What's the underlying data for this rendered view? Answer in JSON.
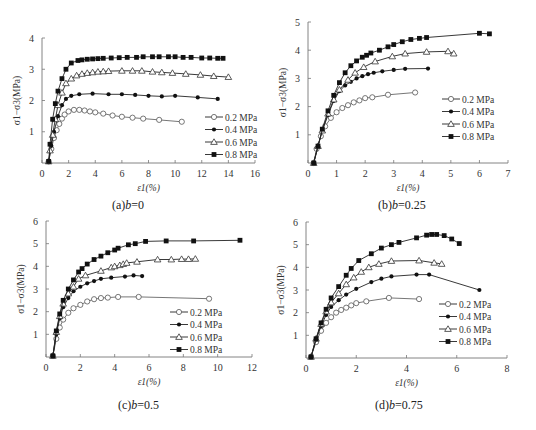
{
  "figure": {
    "panels": [
      {
        "id": "a",
        "caption_prefix": "(a)",
        "caption_var": "b",
        "caption_value": "=0"
      },
      {
        "id": "b",
        "caption_prefix": "(b)",
        "caption_var": "b",
        "caption_value": "=0.25"
      },
      {
        "id": "c",
        "caption_prefix": "(c)",
        "caption_var": "b",
        "caption_value": "=0.5"
      },
      {
        "id": "d",
        "caption_prefix": "(d)",
        "caption_var": "b",
        "caption_value": "=0.75"
      }
    ],
    "xlabel": "ε1(%)",
    "ylabel": "σ1−σ3(MPa)",
    "legend": [
      "0.2  MPa",
      "0.4  MPa",
      "0.6  MPa",
      "0.8  MPa"
    ]
  },
  "chart_data": [
    {
      "type": "line",
      "title": "(a) b=0",
      "xlabel": "ε1(%)",
      "ylabel": "σ1−σ3(MPa)",
      "xlim": [
        0,
        16
      ],
      "ylim": [
        0,
        4
      ],
      "xticks": [
        0,
        2,
        4,
        6,
        8,
        10,
        12,
        14,
        16
      ],
      "yticks": [
        1,
        2,
        3,
        4
      ],
      "legend_position": "right-center",
      "grid": false,
      "series": [
        {
          "name": "0.2 MPa",
          "marker": "open-diamond",
          "x": [
            0.5,
            0.7,
            0.9,
            1.1,
            1.3,
            1.5,
            1.7,
            2.0,
            2.4,
            2.8,
            3.2,
            3.6,
            4.0,
            4.6,
            5.3,
            6.0,
            6.8,
            7.6,
            8.8,
            10.5
          ],
          "y": [
            0.05,
            0.45,
            0.8,
            1.05,
            1.25,
            1.42,
            1.55,
            1.65,
            1.7,
            1.7,
            1.68,
            1.65,
            1.62,
            1.58,
            1.52,
            1.48,
            1.45,
            1.42,
            1.38,
            1.32
          ]
        },
        {
          "name": "0.4 MPa",
          "marker": "filled-circle",
          "x": [
            0.5,
            0.7,
            0.9,
            1.2,
            1.5,
            1.8,
            2.2,
            2.8,
            3.8,
            5.0,
            6.0,
            7.0,
            8.0,
            9.0,
            10.0,
            11.7,
            13.2
          ],
          "y": [
            0.05,
            0.55,
            1.0,
            1.5,
            1.85,
            2.05,
            2.15,
            2.2,
            2.22,
            2.2,
            2.2,
            2.18,
            2.15,
            2.13,
            2.15,
            2.1,
            2.05
          ]
        },
        {
          "name": "0.6 MPa",
          "marker": "open-triangle",
          "x": [
            0.5,
            0.6,
            0.8,
            1.0,
            1.2,
            1.5,
            1.8,
            2.2,
            2.6,
            3.0,
            3.4,
            3.8,
            4.2,
            4.6,
            5.0,
            6.0,
            6.8,
            7.5,
            8.3,
            9.0,
            9.8,
            10.8,
            11.9,
            12.9,
            14.0
          ],
          "y": [
            0.05,
            0.4,
            0.9,
            1.4,
            1.85,
            2.25,
            2.55,
            2.7,
            2.8,
            2.85,
            2.88,
            2.9,
            2.92,
            2.93,
            2.94,
            2.95,
            2.95,
            2.95,
            2.92,
            2.9,
            2.88,
            2.85,
            2.82,
            2.78,
            2.75
          ]
        },
        {
          "name": "0.8 MPa",
          "marker": "filled-square",
          "x": [
            0.5,
            0.6,
            0.8,
            1.0,
            1.2,
            1.5,
            1.8,
            2.2,
            2.7,
            3.0,
            3.4,
            3.8,
            4.2,
            4.6,
            5.2,
            5.8,
            6.4,
            7.1,
            7.6,
            8.3,
            8.8,
            9.5,
            10.0,
            10.6,
            11.2,
            12.0,
            12.6,
            13.2,
            13.6
          ],
          "y": [
            0.05,
            0.6,
            1.4,
            1.9,
            2.3,
            2.7,
            3.0,
            3.2,
            3.28,
            3.3,
            3.32,
            3.33,
            3.34,
            3.35,
            3.36,
            3.37,
            3.38,
            3.38,
            3.4,
            3.4,
            3.4,
            3.4,
            3.4,
            3.38,
            3.38,
            3.36,
            3.36,
            3.35,
            3.35
          ]
        }
      ]
    },
    {
      "type": "line",
      "title": "(b) b=0.25",
      "xlabel": "ε1(%)",
      "ylabel": "σ1−σ3(MPa)",
      "xlim": [
        0,
        7
      ],
      "ylim": [
        0,
        5
      ],
      "xticks": [
        0,
        1,
        2,
        3,
        4,
        5,
        6,
        7
      ],
      "yticks": [
        1,
        2,
        3,
        4,
        5
      ],
      "legend_position": "right-center",
      "grid": false,
      "series": [
        {
          "name": "0.2 MPa",
          "marker": "open-diamond",
          "x": [
            0.2,
            0.3,
            0.45,
            0.6,
            0.8,
            1.0,
            1.2,
            1.4,
            1.6,
            1.8,
            2.0,
            2.25,
            2.8,
            3.75
          ],
          "y": [
            0.0,
            0.5,
            0.95,
            1.3,
            1.6,
            1.8,
            1.95,
            2.05,
            2.15,
            2.22,
            2.3,
            2.33,
            2.42,
            2.5
          ]
        },
        {
          "name": "0.4 MPa",
          "marker": "filled-circle",
          "x": [
            0.2,
            0.35,
            0.5,
            0.7,
            0.9,
            1.1,
            1.3,
            1.5,
            1.7,
            1.9,
            2.1,
            2.3,
            2.6,
            3.0,
            3.4,
            4.2
          ],
          "y": [
            0.0,
            0.6,
            1.15,
            1.7,
            2.2,
            2.55,
            2.75,
            2.88,
            3.0,
            3.08,
            3.15,
            3.2,
            3.25,
            3.3,
            3.34,
            3.35
          ]
        },
        {
          "name": "0.6 MPa",
          "marker": "open-triangle",
          "x": [
            0.2,
            0.35,
            0.5,
            0.7,
            0.9,
            1.1,
            1.4,
            1.65,
            1.95,
            2.35,
            2.95,
            3.4,
            4.15,
            4.9,
            5.1
          ],
          "y": [
            0.0,
            0.6,
            1.15,
            1.75,
            2.25,
            2.6,
            2.95,
            3.2,
            3.4,
            3.6,
            3.78,
            3.88,
            3.94,
            3.96,
            3.88
          ]
        },
        {
          "name": "0.8 MPa",
          "marker": "filled-square",
          "x": [
            0.2,
            0.35,
            0.5,
            0.7,
            0.9,
            1.1,
            1.3,
            1.5,
            1.7,
            1.9,
            2.05,
            2.2,
            2.5,
            2.8,
            3.0,
            3.3,
            3.6,
            3.9,
            4.15,
            6.0,
            6.35
          ],
          "y": [
            0.0,
            0.6,
            1.2,
            1.85,
            2.4,
            2.85,
            3.2,
            3.45,
            3.62,
            3.75,
            3.82,
            3.9,
            4.0,
            4.12,
            4.2,
            4.3,
            4.38,
            4.42,
            4.45,
            4.6,
            4.58
          ]
        }
      ]
    },
    {
      "type": "line",
      "title": "(c) b=0.5",
      "xlabel": "ε1(%)",
      "ylabel": "σ1−σ3(MPa)",
      "xlim": [
        0,
        12
      ],
      "ylim": [
        0,
        6
      ],
      "xticks": [
        0,
        2,
        4,
        6,
        8,
        10,
        12
      ],
      "yticks": [
        1,
        2,
        3,
        4,
        5,
        6
      ],
      "legend_position": "right-lower",
      "grid": false,
      "series": [
        {
          "name": "0.2 MPa",
          "marker": "open-diamond",
          "x": [
            0.4,
            0.6,
            0.8,
            1.0,
            1.3,
            1.6,
            2.0,
            2.4,
            2.8,
            3.2,
            3.6,
            4.2,
            5.4,
            9.5
          ],
          "y": [
            0.05,
            0.8,
            1.3,
            1.65,
            1.95,
            2.15,
            2.3,
            2.45,
            2.55,
            2.6,
            2.62,
            2.65,
            2.65,
            2.57
          ]
        },
        {
          "name": "0.4 MPa",
          "marker": "filled-circle",
          "x": [
            0.4,
            0.6,
            0.8,
            1.0,
            1.3,
            1.6,
            2.0,
            2.4,
            2.8,
            3.2,
            3.8,
            4.6,
            5.1,
            5.6
          ],
          "y": [
            0.05,
            1.0,
            1.7,
            2.2,
            2.6,
            2.9,
            3.1,
            3.25,
            3.35,
            3.45,
            3.5,
            3.55,
            3.6,
            3.57
          ]
        },
        {
          "name": "0.6 MPa",
          "marker": "open-triangle",
          "x": [
            0.4,
            0.6,
            0.8,
            1.0,
            1.3,
            1.6,
            1.9,
            2.3,
            3.2,
            3.8,
            4.0,
            4.3,
            4.5,
            4.7,
            5.3,
            6.5,
            7.3,
            7.9,
            8.3,
            8.7
          ],
          "y": [
            0.05,
            1.1,
            1.8,
            2.35,
            2.8,
            3.1,
            3.45,
            3.6,
            3.8,
            3.95,
            4.0,
            4.05,
            4.1,
            4.15,
            4.2,
            4.3,
            4.3,
            4.32,
            4.32,
            4.33
          ]
        },
        {
          "name": "0.8 MPa",
          "marker": "filled-square",
          "x": [
            0.4,
            0.6,
            0.8,
            1.0,
            1.3,
            1.6,
            1.9,
            2.1,
            2.4,
            2.8,
            3.2,
            3.6,
            4.0,
            4.2,
            4.8,
            5.2,
            5.8,
            7.0,
            8.6,
            11.3
          ],
          "y": [
            0.05,
            1.15,
            1.9,
            2.5,
            3.0,
            3.4,
            3.75,
            3.9,
            4.1,
            4.3,
            4.45,
            4.6,
            4.72,
            4.8,
            4.95,
            5.0,
            5.1,
            5.12,
            5.12,
            5.15
          ]
        }
      ]
    },
    {
      "type": "line",
      "title": "(d) b=0.75",
      "xlabel": "ε1(%)",
      "ylabel": "σ1−σ3(MPa)",
      "xlim": [
        0,
        8
      ],
      "ylim": [
        0,
        6
      ],
      "xticks": [
        0,
        2,
        4,
        6,
        8
      ],
      "yticks": [
        1,
        2,
        3,
        4,
        5,
        6
      ],
      "legend_position": "right-lower",
      "grid": false,
      "series": [
        {
          "name": "0.2 MPa",
          "marker": "open-diamond",
          "x": [
            0.2,
            0.4,
            0.6,
            0.8,
            1.0,
            1.2,
            1.4,
            1.6,
            1.8,
            2.0,
            2.4,
            3.3,
            4.5
          ],
          "y": [
            0.05,
            0.7,
            1.2,
            1.55,
            1.8,
            2.0,
            2.12,
            2.22,
            2.32,
            2.42,
            2.5,
            2.65,
            2.6
          ]
        },
        {
          "name": "0.4 MPa",
          "marker": "filled-circle",
          "x": [
            0.2,
            0.4,
            0.6,
            0.8,
            1.0,
            1.3,
            1.6,
            2.0,
            2.6,
            3.0,
            3.4,
            4.4,
            4.9,
            6.9
          ],
          "y": [
            0.05,
            0.8,
            1.4,
            1.9,
            2.25,
            2.55,
            2.8,
            3.05,
            3.35,
            3.5,
            3.6,
            3.68,
            3.68,
            3.0
          ]
        },
        {
          "name": "0.6 MPa",
          "marker": "open-triangle",
          "x": [
            0.2,
            0.4,
            0.6,
            0.8,
            1.0,
            1.3,
            1.6,
            1.9,
            2.2,
            2.5,
            2.9,
            3.4,
            4.5,
            5.1,
            5.4
          ],
          "y": [
            0.05,
            0.85,
            1.5,
            2.05,
            2.45,
            2.85,
            3.25,
            3.55,
            3.8,
            4.0,
            4.15,
            4.28,
            4.3,
            4.2,
            4.15
          ]
        },
        {
          "name": "0.8 MPa",
          "marker": "filled-square",
          "x": [
            0.2,
            0.4,
            0.6,
            0.8,
            1.0,
            1.3,
            1.6,
            1.8,
            2.1,
            2.6,
            3.0,
            3.4,
            3.7,
            4.4,
            4.8,
            5.0,
            5.2,
            5.5,
            5.8,
            6.1
          ],
          "y": [
            0.05,
            0.85,
            1.55,
            2.15,
            2.65,
            3.15,
            3.65,
            3.95,
            4.3,
            4.6,
            4.85,
            5.0,
            5.1,
            5.3,
            5.42,
            5.45,
            5.45,
            5.4,
            5.25,
            5.05
          ]
        }
      ]
    }
  ]
}
